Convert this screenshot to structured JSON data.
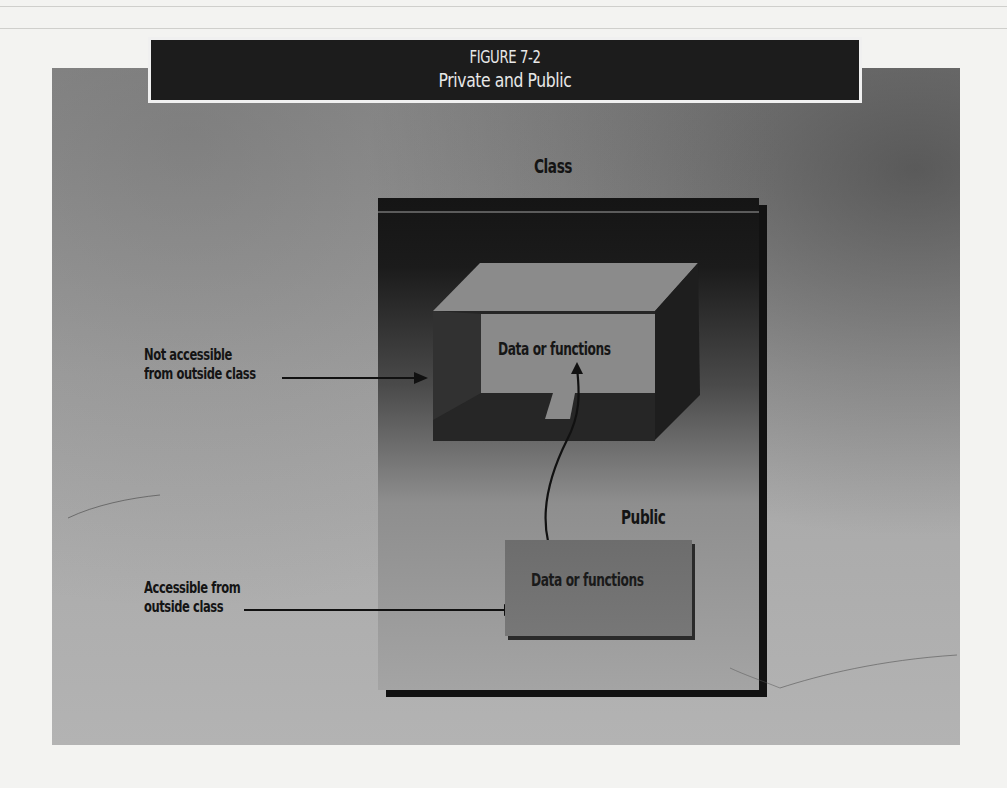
{
  "figure": {
    "number": "FIGURE 7-2",
    "title": "Private and Public"
  },
  "diagram": {
    "class_label": "Class",
    "public_label": "Public",
    "private_section": {
      "content": "Data or functions",
      "annotation": [
        "Not accessible",
        "from outside class"
      ]
    },
    "public_section": {
      "content": "Data or functions",
      "annotation": [
        "Accessible from",
        "outside class"
      ]
    },
    "connections": [
      {
        "from": "public-data-box",
        "to": "private-data-box",
        "style": "curved-arrow"
      },
      {
        "from": "not-accessible-label",
        "to": "private-data-box",
        "style": "straight-arrow"
      },
      {
        "from": "accessible-label",
        "to": "public-data-box",
        "style": "straight-arrow"
      }
    ]
  },
  "colors": {
    "banner_bg": "#1c1c1c",
    "banner_text": "#e8e8e8",
    "panel_bg": "#a6a6a6",
    "class_box_top": "#151515",
    "class_box_bottom": "#a4a4a4",
    "public_box": "#717171",
    "text": "#141414"
  }
}
